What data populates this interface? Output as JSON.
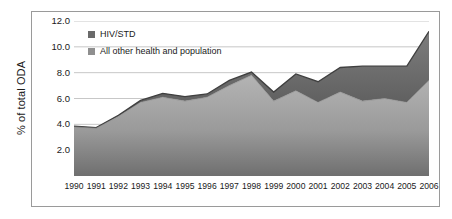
{
  "chart_data": {
    "type": "area",
    "stacked": true,
    "title": "",
    "xlabel": "",
    "ylabel": "% of total ODA",
    "ylim": [
      0,
      12
    ],
    "ytick_values": [
      12.0,
      10.0,
      8.0,
      6.0,
      4.0,
      2.0
    ],
    "ytick_labels": [
      "12.0",
      "10.0",
      "8.0",
      "6.0",
      "4.0",
      "2.0"
    ],
    "grid": true,
    "grid_axis": "y",
    "legend_position": "upper-left-inside",
    "categories": [
      1990,
      1991,
      1992,
      1993,
      1994,
      1995,
      1996,
      1997,
      1998,
      1999,
      2000,
      2001,
      2002,
      2003,
      2004,
      2005,
      2006
    ],
    "xtick_labels": [
      "1990",
      "1991",
      "1992",
      "1993",
      "1994",
      "1995",
      "1996",
      "1997",
      "1998",
      "1999",
      "2000",
      "2001",
      "2002",
      "2003",
      "2004",
      "2005",
      "2006"
    ],
    "series": [
      {
        "name": "All other health and population",
        "color": "#9e9e9e",
        "values": [
          3.8,
          3.7,
          4.6,
          5.7,
          6.1,
          5.8,
          6.1,
          7.0,
          7.8,
          5.8,
          6.6,
          5.7,
          6.5,
          5.8,
          6.0,
          5.7,
          7.4
        ]
      },
      {
        "name": "HIV/STD",
        "color": "#6a6a6a",
        "values": [
          0.05,
          0.05,
          0.1,
          0.15,
          0.3,
          0.35,
          0.25,
          0.4,
          0.25,
          0.7,
          1.3,
          1.6,
          1.9,
          2.7,
          2.5,
          2.8,
          3.8
        ]
      }
    ],
    "totals": [
      3.85,
      3.75,
      4.7,
      5.85,
      6.4,
      6.15,
      6.35,
      7.4,
      8.05,
      6.5,
      7.9,
      7.3,
      8.4,
      8.5,
      8.5,
      8.5,
      11.2
    ]
  },
  "legend": {
    "entries": [
      {
        "label": "HIV/STD",
        "color": "#6a6a6a"
      },
      {
        "label": "All other health and population",
        "color": "#8f8f8f"
      }
    ]
  },
  "axis": {
    "y_title": "% of total ODA"
  }
}
